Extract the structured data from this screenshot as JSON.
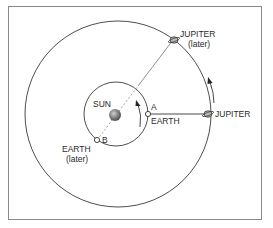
{
  "diagram": {
    "labels": {
      "sun": "SUN",
      "earth": "EARTH",
      "earth_later_line1": "EARTH",
      "earth_later_line2": "(later)",
      "jupiter": "JUPITER",
      "jupiter_later_line1": "JUPITER",
      "jupiter_later_line2": "(later)",
      "point_a": "A",
      "point_b": "B"
    },
    "colors": {
      "line": "#333333",
      "frame": "#8a8a8a",
      "sun": "#7a7a7a",
      "dashed": "#888888"
    }
  }
}
